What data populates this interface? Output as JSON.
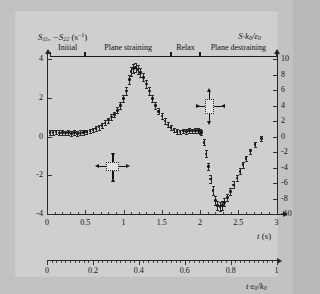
{
  "chart_data": {
    "type": "scatter",
    "title": "",
    "xlabel": "t (s)",
    "ylabel": "S11, -S22 (s^-1)",
    "y2label": "S*k0/e0",
    "x2label": "t*e0/k0",
    "xlim": [
      0,
      3
    ],
    "ylim": [
      -4,
      4
    ],
    "y2lim": [
      -10,
      10
    ],
    "x2lim": [
      0,
      1
    ],
    "grid": false,
    "legend": "none",
    "xticks": [
      "0",
      "0.5",
      "1",
      "1.5",
      "2",
      "2.5",
      "3"
    ],
    "xtick_values": [
      0,
      0.5,
      1,
      1.5,
      2,
      2.5,
      3
    ],
    "yticks": [
      "4",
      "2",
      "0",
      "-2",
      "-4"
    ],
    "ytick_values": [
      4,
      2,
      0,
      -2,
      -4
    ],
    "y2ticks": [
      "10",
      "8",
      "6",
      "4",
      "2",
      "0",
      "-2",
      "-4",
      "-6",
      "-8",
      "-10"
    ],
    "y2tick_values": [
      10,
      8,
      6,
      4,
      2,
      0,
      -2,
      -4,
      -6,
      -8,
      -10
    ],
    "x2ticks": [
      "0",
      "0.2",
      "0.4",
      "0.6",
      "0.8",
      "1"
    ],
    "x2tick_values": [
      0,
      0.2,
      0.4,
      0.6,
      0.8,
      1
    ],
    "series": [
      {
        "name": "S11, -S22",
        "x": [
          0.04,
          0.08,
          0.12,
          0.16,
          0.2,
          0.24,
          0.28,
          0.32,
          0.36,
          0.4,
          0.44,
          0.48,
          0.52,
          0.56,
          0.6,
          0.64,
          0.68,
          0.72,
          0.76,
          0.8,
          0.84,
          0.88,
          0.92,
          0.96,
          1.0,
          1.04,
          1.08,
          1.1,
          1.13,
          1.16,
          1.19,
          1.22,
          1.26,
          1.3,
          1.34,
          1.38,
          1.42,
          1.46,
          1.5,
          1.54,
          1.58,
          1.62,
          1.66,
          1.7,
          1.74,
          1.78,
          1.82,
          1.86,
          1.9,
          1.94,
          1.98,
          2.0,
          2.02,
          2.05,
          2.08,
          2.11,
          2.14,
          2.17,
          2.2,
          2.23,
          2.26,
          2.29,
          2.32,
          2.36,
          2.4,
          2.44,
          2.48,
          2.52,
          2.56,
          2.6,
          2.66,
          2.72,
          2.8
        ],
        "y": [
          0.22,
          0.2,
          0.24,
          0.19,
          0.22,
          0.18,
          0.21,
          0.17,
          0.2,
          0.16,
          0.19,
          0.22,
          0.24,
          0.28,
          0.33,
          0.4,
          0.48,
          0.58,
          0.7,
          0.85,
          1.0,
          1.15,
          1.35,
          1.6,
          1.95,
          2.35,
          2.95,
          3.35,
          3.5,
          3.55,
          3.45,
          3.3,
          3.05,
          2.7,
          2.35,
          1.95,
          1.6,
          1.3,
          1.05,
          0.8,
          0.6,
          0.45,
          0.33,
          0.26,
          0.24,
          0.28,
          0.26,
          0.3,
          0.28,
          0.32,
          0.3,
          0.24,
          0.2,
          -0.3,
          -0.9,
          -1.55,
          -2.2,
          -2.8,
          -3.3,
          -3.55,
          -3.6,
          -3.55,
          -3.4,
          -3.15,
          -2.85,
          -2.5,
          -2.15,
          -1.8,
          -1.45,
          -1.15,
          -0.75,
          -0.4,
          -0.1
        ],
        "yerr": [
          0.12,
          0.12,
          0.12,
          0.12,
          0.12,
          0.12,
          0.12,
          0.12,
          0.12,
          0.12,
          0.12,
          0.12,
          0.12,
          0.12,
          0.12,
          0.12,
          0.12,
          0.12,
          0.13,
          0.13,
          0.14,
          0.14,
          0.15,
          0.16,
          0.18,
          0.2,
          0.22,
          0.24,
          0.24,
          0.24,
          0.23,
          0.22,
          0.21,
          0.2,
          0.19,
          0.18,
          0.17,
          0.16,
          0.15,
          0.14,
          0.13,
          0.13,
          0.12,
          0.12,
          0.12,
          0.12,
          0.12,
          0.12,
          0.12,
          0.12,
          0.12,
          0.13,
          0.14,
          0.16,
          0.18,
          0.2,
          0.22,
          0.23,
          0.24,
          0.24,
          0.23,
          0.22,
          0.21,
          0.2,
          0.19,
          0.18,
          0.17,
          0.16,
          0.15,
          0.14,
          0.13,
          0.13,
          0.12
        ],
        "marker": "circle",
        "color": "#141414"
      }
    ],
    "phases": [
      {
        "label": "Initial",
        "x_start": 0.04,
        "x_end": 0.5
      },
      {
        "label": "Plane straining",
        "x_start": 0.5,
        "x_end": 1.62
      },
      {
        "label": "Relax",
        "x_start": 1.62,
        "x_end": 2.0
      },
      {
        "label": "Plane destraining",
        "x_start": 2.0,
        "x_end": 3.0
      }
    ],
    "annotations": [
      {
        "name": "plane-straining-element",
        "x": 0.86,
        "y": -1.55,
        "shape": "rect-wide",
        "horizontal_arrows": "outward",
        "vertical_arrows": "inward"
      },
      {
        "name": "plane-destraining-element",
        "x": 2.12,
        "y": 1.55,
        "shape": "rect-tall",
        "horizontal_arrows": "inward",
        "vertical_arrows": "outward"
      }
    ]
  },
  "axes": {
    "left_title_main": "S",
    "left_title_sub1": "11",
    "left_title_mid": ", −S",
    "left_title_sub2": "22",
    "left_title_unit_open": " (s",
    "left_title_sup": "−1",
    "left_title_close": ")",
    "right_title_main": "S·k",
    "right_title_sub1": "0",
    "right_title_slash": "/ε",
    "right_title_sub2": "0",
    "bottom_title_main": "t",
    "bottom_title_unit": " (s)",
    "bottom2_title_main": "t·ε",
    "bottom2_title_sub1": "0",
    "bottom2_title_slash": "/k",
    "bottom2_title_sub2": "0"
  }
}
